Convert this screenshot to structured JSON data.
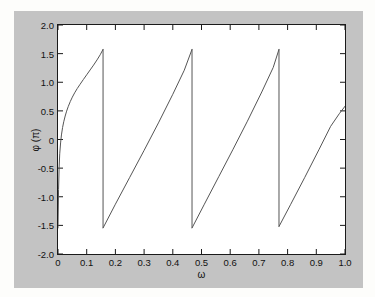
{
  "figure": {
    "background_color": "#c3c3c3",
    "axes_background_color": "#ffffff",
    "axes_border_color": "#1a1a1a",
    "line_color": "#555555"
  },
  "chart_data": {
    "type": "line",
    "title": "",
    "xlabel": "ω",
    "ylabel": "φ (π)",
    "xlim": [
      0,
      1.0
    ],
    "ylim": [
      -2.0,
      2.0
    ],
    "grid": false,
    "legend": null,
    "xticks": [
      0,
      0.1,
      0.2,
      0.3,
      0.4,
      0.5,
      0.6,
      0.7,
      0.8,
      0.9,
      1.0
    ],
    "xticklabels": [
      "0",
      "0.1",
      "0.2",
      "0.3",
      "0.4",
      "0.5",
      "0.6",
      "0.7",
      "0.8",
      "0.9",
      "1.0"
    ],
    "yticks": [
      -2.0,
      -1.5,
      -1.0,
      -0.5,
      0,
      0.5,
      1.0,
      1.5,
      2.0
    ],
    "yticklabels": [
      "-2.0",
      "-1.5",
      "-1.0",
      "-0.5",
      "0",
      "0.5",
      "1.0",
      "1.5",
      "2.0"
    ],
    "discontinuities_x": [
      0.157,
      0.467,
      0.77
    ],
    "jump_from": 1.575,
    "jump_to": -1.545,
    "series": [
      {
        "name": "phase",
        "segments": [
          {
            "x": [
              0.0,
              0.002,
              0.004,
              0.006,
              0.009,
              0.012,
              0.016,
              0.02,
              0.025,
              0.03,
              0.036,
              0.043,
              0.05,
              0.058,
              0.067,
              0.077,
              0.088,
              0.1,
              0.112,
              0.124,
              0.136,
              0.147,
              0.157
            ],
            "y": [
              -1.545,
              -0.87,
              -0.48,
              -0.25,
              -0.06,
              0.08,
              0.21,
              0.31,
              0.41,
              0.495,
              0.58,
              0.665,
              0.74,
              0.815,
              0.89,
              0.965,
              1.045,
              1.13,
              1.215,
              1.3,
              1.39,
              1.48,
              1.575
            ]
          },
          {
            "x": [
              0.157,
              0.2,
              0.25,
              0.3,
              0.35,
              0.4,
              0.44,
              0.467
            ],
            "y": [
              -1.545,
              -1.13,
              -0.66,
              -0.19,
              0.29,
              0.79,
              1.21,
              1.575
            ]
          },
          {
            "x": [
              0.467,
              0.51,
              0.56,
              0.61,
              0.66,
              0.71,
              0.75,
              0.77
            ],
            "y": [
              -1.545,
              -1.13,
              -0.65,
              -0.17,
              0.32,
              0.83,
              1.26,
              1.575
            ]
          },
          {
            "x": [
              0.77,
              0.81,
              0.86,
              0.91,
              0.95,
              0.98,
              1.0
            ],
            "y": [
              -1.52,
              -1.14,
              -0.66,
              -0.17,
              0.23,
              0.45,
              0.58
            ]
          }
        ]
      }
    ]
  },
  "page_bleed_text": [
    {
      "t": "contains these plots",
      "x": 118,
      "y": 28
    },
    {
      "t": "The phase plot shows that the",
      "x": 58,
      "y": 47
    },
    {
      "t": "The magnitude plot of",
      "x": 70,
      "y": 63
    },
    {
      "t": "the filter",
      "x": 100,
      "y": 79
    },
    {
      "t": "The filter",
      "x": 62,
      "y": 99
    },
    {
      "t": "identical to the original",
      "x": 52,
      "y": 114
    },
    {
      "t": "The frequency response",
      "x": 47,
      "y": 132
    },
    {
      "t": "with fewer taps, and accurate",
      "x": 40,
      "y": 147
    },
    {
      "t": "to within",
      "x": 92,
      "y": 163
    },
    {
      "t": "The filter output is the",
      "x": 44,
      "y": 183
    },
    {
      "t": "estimate of the signal phase",
      "x": 38,
      "y": 198
    },
    {
      "t": "Compare observed and true limits",
      "x": 30,
      "y": 214
    },
    {
      "t": "of the response",
      "x": 80,
      "y": 229
    }
  ]
}
